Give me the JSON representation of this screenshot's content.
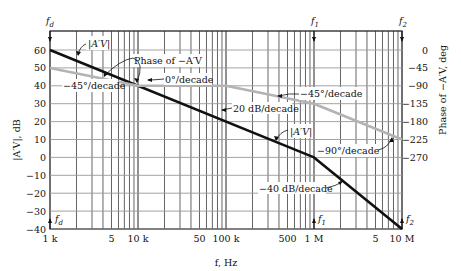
{
  "chart_data": {
    "type": "line",
    "title": "",
    "xlabel": "f, Hz",
    "ylabel": "|A'V|, dB",
    "ylabel_right": "Phase of −A'V, deg",
    "xscale": "log",
    "xlim": [
      1000,
      10000000
    ],
    "ylim": [
      -40,
      60
    ],
    "ylim_right": [
      -270,
      0
    ],
    "grid": true,
    "x_ticks": [
      {
        "value": 1000,
        "label": "1 k"
      },
      {
        "value": 5000,
        "label": "5"
      },
      {
        "value": 10000,
        "label": "10 k"
      },
      {
        "value": 50000,
        "label": "50"
      },
      {
        "value": 100000,
        "label": "100 k"
      },
      {
        "value": 500000,
        "label": "500"
      },
      {
        "value": 1000000,
        "label": "1 M"
      },
      {
        "value": 5000000,
        "label": "5"
      },
      {
        "value": 10000000,
        "label": "10 M"
      }
    ],
    "y_ticks": [
      "60",
      "50",
      "40",
      "30",
      "20",
      "10",
      "0",
      "−10",
      "−20",
      "−30",
      "−40"
    ],
    "y_ticks_right": [
      "0",
      "−45",
      "−90",
      "−135",
      "−180",
      "−225",
      "−270"
    ],
    "series": [
      {
        "name": "|A'V|",
        "color": "#111111",
        "x": [
          1000,
          1000000,
          10000000
        ],
        "y": [
          60,
          0,
          -40
        ]
      },
      {
        "name": "Phase of −A'V",
        "color": "#b3b3b3",
        "axis": "right",
        "x": [
          1000,
          10000,
          100000,
          1000000,
          10000000
        ],
        "y": [
          -45,
          -90,
          -90,
          -135,
          -225
        ]
      }
    ],
    "annotations": [
      {
        "text": "f_d",
        "at": 1000
      },
      {
        "text": "f_1",
        "at": 1000000
      },
      {
        "text": "f_2",
        "at": 10000000
      },
      {
        "text": "|A'V|"
      },
      {
        "text": "Phase of −A'V"
      },
      {
        "text": "−45°/decade"
      },
      {
        "text": "0°/decade"
      },
      {
        "text": "20 dB/decade"
      },
      {
        "text": "−45°/decade"
      },
      {
        "text": "|A'V|"
      },
      {
        "text": "−90°/decade"
      },
      {
        "text": "−40 dB/decade"
      }
    ]
  },
  "labels": {
    "xlabel": "f, Hz",
    "ylabel": "|A′V|, dB",
    "ylabel_right": "Phase of −A′V, deg",
    "fd": "f",
    "fd_sub": "d",
    "f1": "f",
    "f1_sub": "1",
    "f2": "f",
    "f2_sub": "2",
    "mag_label": "|A′V|",
    "mag_label2": "|A′V|",
    "phase_label": "Phase of −A′V",
    "slope_m45_a": "−45°/decade",
    "slope_0": "0°/decade",
    "slope_20db": "20 dB/decade",
    "slope_m45_b": "−45°/decade",
    "slope_m90": "−90°/decade",
    "slope_m40db": "−40 dB/decade"
  }
}
